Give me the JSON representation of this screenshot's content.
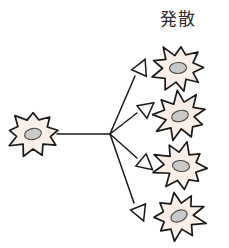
{
  "figure": {
    "title": "発散",
    "label_name": "divergence-label",
    "description_type": "diagram",
    "colors": {
      "background": "#ffffff",
      "cell_fill": "#faeee9",
      "cell_stroke": "#1a1a1a",
      "nucleus_fill": "#c9c9c9",
      "nucleus_stroke": "#4a4a4a",
      "line_stroke": "#1a1a1a",
      "arrow_fill": "#ffffff",
      "text": "#2b2b2b"
    },
    "hub": {
      "x": 110,
      "y": 134
    },
    "source_cell": {
      "name": "source-cell",
      "cx": 33,
      "cy": 134,
      "rx": 27,
      "ry": 23,
      "nucleus_rx": 8.5,
      "nucleus_ry": 5.5,
      "nucleus_rotate": -12
    },
    "trunk_line": {
      "name": "trunk-line",
      "x1": 57,
      "y1": 134,
      "x2": 110,
      "y2": 134
    },
    "branches": [
      {
        "name": "branch-1",
        "x1": 110,
        "y1": 134,
        "x2": 135,
        "y2": 76,
        "arrow_x": 139,
        "arrow_y": 73,
        "arrow_rotate": -66
      },
      {
        "name": "branch-2",
        "x1": 110,
        "y1": 134,
        "x2": 137,
        "y2": 113,
        "arrow_x": 142,
        "arrow_y": 112,
        "arrow_rotate": -38
      },
      {
        "name": "branch-3",
        "x1": 110,
        "y1": 134,
        "x2": 137,
        "y2": 158,
        "arrow_x": 141,
        "arrow_y": 160,
        "arrow_rotate": 40
      },
      {
        "name": "branch-4",
        "x1": 110,
        "y1": 134,
        "x2": 134,
        "y2": 203,
        "arrow_x": 138,
        "arrow_y": 207,
        "arrow_rotate": 68
      }
    ],
    "target_cells": [
      {
        "name": "target-cell-1",
        "cx": 178,
        "cy": 68,
        "rx": 27,
        "ry": 24,
        "nucleus_rx": 8.5,
        "nucleus_ry": 5.5,
        "nucleus_rotate": -12,
        "rotate": 8
      },
      {
        "name": "target-cell-2",
        "cx": 180,
        "cy": 116,
        "rx": 27,
        "ry": 24,
        "nucleus_rx": 8.5,
        "nucleus_ry": 5.5,
        "nucleus_rotate": -10,
        "rotate": -6
      },
      {
        "name": "target-cell-3",
        "cx": 181,
        "cy": 166,
        "rx": 27,
        "ry": 24,
        "nucleus_rx": 8.5,
        "nucleus_ry": 5.5,
        "nucleus_rotate": -8,
        "rotate": 14
      },
      {
        "name": "target-cell-4",
        "cx": 179,
        "cy": 216,
        "rx": 27,
        "ry": 24,
        "nucleus_rx": 8.5,
        "nucleus_ry": 5.5,
        "nucleus_rotate": -12,
        "rotate": -12
      }
    ],
    "arrow_head": {
      "name": "arrow-head",
      "length": 15,
      "half_width": 8
    },
    "spike_count": 9
  }
}
